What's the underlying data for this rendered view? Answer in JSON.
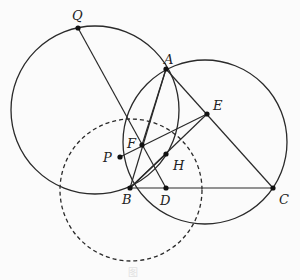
{
  "figure": {
    "points": [
      {
        "name": "Q",
        "x": 78,
        "y": 28,
        "lx": 72,
        "ly": 20
      },
      {
        "name": "A",
        "x": 166,
        "y": 69,
        "lx": 164,
        "ly": 64
      },
      {
        "name": "E",
        "x": 207,
        "y": 114,
        "lx": 213,
        "ly": 110
      },
      {
        "name": "F",
        "x": 142,
        "y": 145,
        "lx": 127,
        "ly": 148
      },
      {
        "name": "P",
        "x": 120,
        "y": 157,
        "lx": 103,
        "ly": 162
      },
      {
        "name": "H",
        "x": 166,
        "y": 154,
        "lx": 173,
        "ly": 170
      },
      {
        "name": "B",
        "x": 130,
        "y": 188,
        "lx": 122,
        "ly": 204
      },
      {
        "name": "D",
        "x": 166,
        "y": 188,
        "lx": 160,
        "ly": 205
      },
      {
        "name": "C",
        "x": 273,
        "y": 188,
        "lx": 279,
        "ly": 204
      }
    ],
    "circles": [
      {
        "name": "circle-left",
        "cx": 95,
        "cy": 110,
        "r": 84,
        "dashed": false
      },
      {
        "name": "circle-abc",
        "cx": 205,
        "cy": 142,
        "r": 82,
        "dashed": false
      },
      {
        "name": "circle-dashed",
        "cx": 131,
        "cy": 190,
        "r": 71,
        "dashed": true
      }
    ],
    "segments": [
      [
        "Q",
        "D"
      ],
      [
        "A",
        "B"
      ],
      [
        "A",
        "C"
      ],
      [
        "B",
        "C"
      ],
      [
        "B",
        "E"
      ],
      [
        "P",
        "E"
      ],
      [
        "B",
        "H"
      ],
      [
        "A",
        "F"
      ]
    ],
    "caption": "图"
  }
}
